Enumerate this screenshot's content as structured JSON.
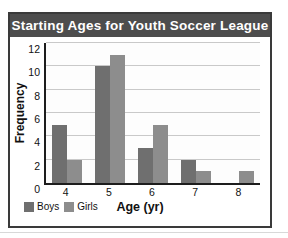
{
  "chart_data": {
    "type": "bar",
    "title": "Starting Ages for Youth Soccer League",
    "xlabel": "Age (yr)",
    "ylabel": "Frequency",
    "categories": [
      "4",
      "5",
      "6",
      "7",
      "8"
    ],
    "series": [
      {
        "name": "Boys",
        "color": "#6f6f6f",
        "values": [
          5,
          10,
          3,
          2,
          0
        ]
      },
      {
        "name": "Girls",
        "color": "#8d8d8d",
        "values": [
          2,
          11,
          5,
          1,
          1
        ]
      }
    ],
    "ylim": [
      0,
      12
    ],
    "yticks": [
      0,
      2,
      4,
      6,
      8,
      10,
      12
    ],
    "ytick_labels": [
      "0",
      "2",
      "4",
      "6",
      "8",
      "10",
      "12"
    ],
    "grid": true,
    "legend_position": "bottom-left"
  },
  "header": {
    "title": "Starting Ages for Youth Soccer League",
    "bg_color": "#4d4d4d",
    "text_color": "#ffffff"
  },
  "legend": {
    "items": [
      {
        "label": "Boys",
        "color": "#6f6f6f"
      },
      {
        "label": "Girls",
        "color": "#8d8d8d"
      }
    ]
  }
}
